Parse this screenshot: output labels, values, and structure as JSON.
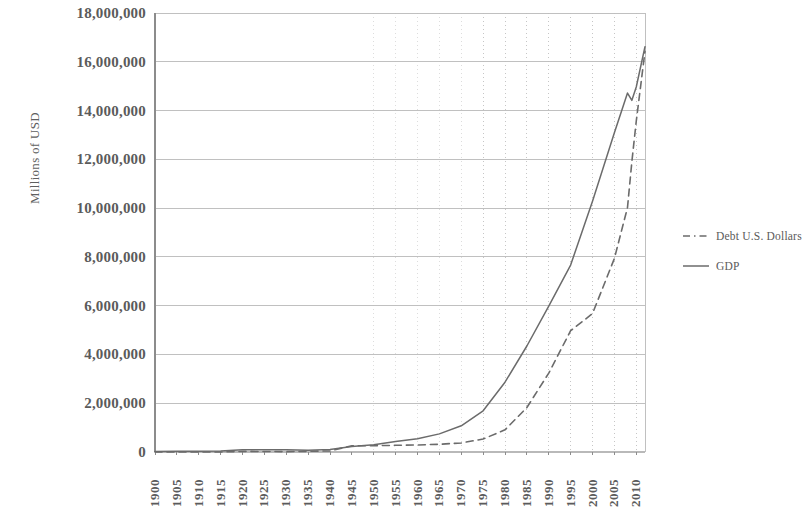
{
  "chart_data": {
    "type": "line",
    "title": "",
    "xlabel": "",
    "ylabel": "Millions of USD",
    "xlim": [
      1900,
      2012
    ],
    "ylim": [
      0,
      18000000
    ],
    "grid": true,
    "legend_position": "right",
    "y_ticks": [
      "18,000,000",
      "16,000,000",
      "14,000,000",
      "12,000,000",
      "10,000,000",
      "8,000,000",
      "6,000,000",
      "4,000,000",
      "2,000,000",
      "0"
    ],
    "y_tick_values": [
      18000000,
      16000000,
      14000000,
      12000000,
      10000000,
      8000000,
      6000000,
      4000000,
      2000000,
      0
    ],
    "x_ticks": [
      "1900",
      "1905",
      "1910",
      "1915",
      "1920",
      "1925",
      "1930",
      "1935",
      "1940",
      "1945",
      "1950",
      "1955",
      "1960",
      "1965",
      "1970",
      "1975",
      "1980",
      "1985",
      "1990",
      "1995",
      "2000",
      "2005",
      "2010"
    ],
    "x_tick_values": [
      1900,
      1905,
      1910,
      1915,
      1920,
      1925,
      1930,
      1935,
      1940,
      1945,
      1950,
      1955,
      1960,
      1965,
      1970,
      1975,
      1980,
      1985,
      1990,
      1995,
      2000,
      2005,
      2010
    ],
    "x": [
      1900,
      1905,
      1910,
      1915,
      1920,
      1925,
      1930,
      1935,
      1940,
      1945,
      1950,
      1955,
      1960,
      1965,
      1970,
      1975,
      1980,
      1985,
      1990,
      1995,
      2000,
      2005,
      2008,
      2009,
      2010,
      2012
    ],
    "series": [
      {
        "name": "GDP",
        "style": "solid",
        "color": "#6b6b6b",
        "values": [
          20500,
          28800,
          33400,
          40000,
          88400,
          93800,
          92200,
          73300,
          102900,
          228000,
          300200,
          426200,
          542400,
          743700,
          1075900,
          1688900,
          2862500,
          4346700,
          5979600,
          7664100,
          10284800,
          13093700,
          14718600,
          14418700,
          14964400,
          16620000
        ]
      },
      {
        "name": "Debt U.S. Dollars",
        "style": "dashed",
        "color": "#6b6b6b",
        "values": [
          2136,
          1132,
          1147,
          1191,
          25952,
          20516,
          16185,
          28701,
          42968,
          258682,
          257357,
          274366,
          286331,
          317274,
          370919,
          533189,
          907701,
          1823103,
          3233313,
          4973983,
          5674178,
          7932710,
          10024725,
          11909829,
          13561623,
          16432730
        ]
      }
    ],
    "legend": [
      {
        "label": "Debt U.S. Dollars",
        "style": "dashed"
      },
      {
        "label": "GDP",
        "style": "solid"
      }
    ]
  },
  "colors": {
    "axis": "#8c8c8c",
    "grid": "#b9b9b9",
    "vgrid": "#bdbdbd",
    "line": "#6b6b6b",
    "text": "#5b5b5b"
  }
}
